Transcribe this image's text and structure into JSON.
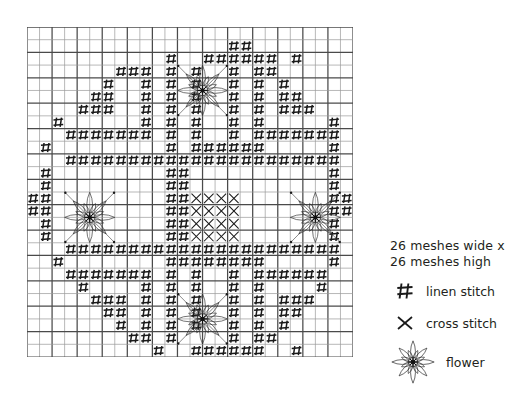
{
  "chart": {
    "name": "needlework-pattern-chart",
    "type": "stitch-chart",
    "cols": 26,
    "rows": 26,
    "cell_px": 12.54,
    "grid_color": "#4a4a4a",
    "grid_color_light": "#9a9a9a",
    "symbol_color": "#1a1a1a",
    "heavy_line_every": 2,
    "symbols": {
      "linen": "#",
      "cross": "×",
      "flower": "flower"
    },
    "linen_cells": [
      [
        16,
        1
      ],
      [
        17,
        1
      ],
      [
        11,
        2
      ],
      [
        14,
        2
      ],
      [
        15,
        2
      ],
      [
        16,
        2
      ],
      [
        17,
        2
      ],
      [
        18,
        2
      ],
      [
        19,
        2
      ],
      [
        21,
        2
      ],
      [
        8,
        3
      ],
      [
        9,
        3
      ],
      [
        11,
        3
      ],
      [
        13,
        3
      ],
      [
        16,
        3
      ],
      [
        18,
        3
      ],
      [
        19,
        3
      ],
      [
        7,
        3
      ],
      [
        6,
        4
      ],
      [
        9,
        4
      ],
      [
        11,
        4
      ],
      [
        13,
        4
      ],
      [
        16,
        4
      ],
      [
        18,
        4
      ],
      [
        20,
        4
      ],
      [
        5,
        5
      ],
      [
        6,
        5
      ],
      [
        9,
        5
      ],
      [
        11,
        5
      ],
      [
        13,
        5
      ],
      [
        16,
        5
      ],
      [
        18,
        5
      ],
      [
        20,
        5
      ],
      [
        21,
        5
      ],
      [
        4,
        6
      ],
      [
        5,
        6
      ],
      [
        6,
        6
      ],
      [
        9,
        6
      ],
      [
        11,
        6
      ],
      [
        13,
        6
      ],
      [
        16,
        6
      ],
      [
        18,
        6
      ],
      [
        20,
        6
      ],
      [
        21,
        6
      ],
      [
        22,
        6
      ],
      [
        2,
        7
      ],
      [
        9,
        7
      ],
      [
        11,
        7
      ],
      [
        13,
        7
      ],
      [
        16,
        7
      ],
      [
        18,
        7
      ],
      [
        24,
        7
      ],
      [
        3,
        8
      ],
      [
        4,
        8
      ],
      [
        5,
        8
      ],
      [
        6,
        8
      ],
      [
        7,
        8
      ],
      [
        8,
        8
      ],
      [
        9,
        8
      ],
      [
        11,
        8
      ],
      [
        13,
        8
      ],
      [
        16,
        8
      ],
      [
        18,
        8
      ],
      [
        19,
        8
      ],
      [
        20,
        8
      ],
      [
        21,
        8
      ],
      [
        22,
        8
      ],
      [
        23,
        8
      ],
      [
        24,
        8
      ],
      [
        1,
        9
      ],
      [
        11,
        9
      ],
      [
        13,
        9
      ],
      [
        14,
        9
      ],
      [
        15,
        9
      ],
      [
        16,
        9
      ],
      [
        17,
        9
      ],
      [
        18,
        9
      ],
      [
        24,
        9
      ],
      [
        3,
        10
      ],
      [
        4,
        10
      ],
      [
        5,
        10
      ],
      [
        6,
        10
      ],
      [
        7,
        10
      ],
      [
        8,
        10
      ],
      [
        9,
        10
      ],
      [
        10,
        10
      ],
      [
        11,
        10
      ],
      [
        12,
        10
      ],
      [
        13,
        10
      ],
      [
        14,
        10
      ],
      [
        15,
        10
      ],
      [
        16,
        10
      ],
      [
        17,
        10
      ],
      [
        18,
        10
      ],
      [
        19,
        10
      ],
      [
        20,
        10
      ],
      [
        21,
        10
      ],
      [
        22,
        10
      ],
      [
        23,
        10
      ],
      [
        24,
        10
      ],
      [
        1,
        11
      ],
      [
        11,
        11
      ],
      [
        12,
        11
      ],
      [
        24,
        11
      ],
      [
        1,
        12
      ],
      [
        11,
        12
      ],
      [
        12,
        12
      ],
      [
        24,
        12
      ],
      [
        0,
        13
      ],
      [
        1,
        13
      ],
      [
        11,
        13
      ],
      [
        12,
        13
      ],
      [
        24,
        13
      ],
      [
        25,
        13
      ],
      [
        0,
        14
      ],
      [
        1,
        14
      ],
      [
        11,
        14
      ],
      [
        12,
        14
      ],
      [
        24,
        14
      ],
      [
        25,
        14
      ],
      [
        1,
        15
      ],
      [
        11,
        15
      ],
      [
        12,
        15
      ],
      [
        24,
        15
      ],
      [
        1,
        16
      ],
      [
        11,
        16
      ],
      [
        12,
        16
      ],
      [
        24,
        16
      ],
      [
        3,
        17
      ],
      [
        4,
        17
      ],
      [
        5,
        17
      ],
      [
        6,
        17
      ],
      [
        7,
        17
      ],
      [
        8,
        17
      ],
      [
        9,
        17
      ],
      [
        10,
        17
      ],
      [
        11,
        17
      ],
      [
        12,
        17
      ],
      [
        13,
        17
      ],
      [
        14,
        17
      ],
      [
        15,
        17
      ],
      [
        16,
        17
      ],
      [
        17,
        17
      ],
      [
        18,
        17
      ],
      [
        19,
        17
      ],
      [
        20,
        17
      ],
      [
        21,
        17
      ],
      [
        22,
        17
      ],
      [
        23,
        17
      ],
      [
        24,
        17
      ],
      [
        2,
        18
      ],
      [
        11,
        18
      ],
      [
        12,
        18
      ],
      [
        13,
        18
      ],
      [
        14,
        18
      ],
      [
        15,
        18
      ],
      [
        16,
        18
      ],
      [
        17,
        18
      ],
      [
        18,
        18
      ],
      [
        24,
        18
      ],
      [
        3,
        19
      ],
      [
        4,
        19
      ],
      [
        5,
        19
      ],
      [
        6,
        19
      ],
      [
        7,
        19
      ],
      [
        8,
        19
      ],
      [
        9,
        19
      ],
      [
        11,
        19
      ],
      [
        13,
        19
      ],
      [
        16,
        19
      ],
      [
        18,
        19
      ],
      [
        19,
        19
      ],
      [
        20,
        19
      ],
      [
        21,
        19
      ],
      [
        22,
        19
      ],
      [
        23,
        19
      ],
      [
        4,
        20
      ],
      [
        9,
        20
      ],
      [
        11,
        20
      ],
      [
        13,
        20
      ],
      [
        16,
        20
      ],
      [
        18,
        20
      ],
      [
        23,
        20
      ],
      [
        5,
        21
      ],
      [
        6,
        21
      ],
      [
        7,
        21
      ],
      [
        9,
        21
      ],
      [
        11,
        21
      ],
      [
        13,
        21
      ],
      [
        16,
        21
      ],
      [
        18,
        21
      ],
      [
        20,
        21
      ],
      [
        21,
        21
      ],
      [
        22,
        21
      ],
      [
        6,
        22
      ],
      [
        7,
        22
      ],
      [
        9,
        22
      ],
      [
        11,
        22
      ],
      [
        13,
        22
      ],
      [
        16,
        22
      ],
      [
        18,
        22
      ],
      [
        20,
        22
      ],
      [
        21,
        22
      ],
      [
        7,
        23
      ],
      [
        9,
        23
      ],
      [
        11,
        23
      ],
      [
        13,
        23
      ],
      [
        16,
        23
      ],
      [
        18,
        23
      ],
      [
        20,
        23
      ],
      [
        8,
        24
      ],
      [
        9,
        24
      ],
      [
        11,
        24
      ],
      [
        16,
        24
      ],
      [
        18,
        24
      ],
      [
        19,
        24
      ],
      [
        10,
        25
      ],
      [
        13,
        25
      ],
      [
        14,
        25
      ],
      [
        15,
        25
      ],
      [
        16,
        25
      ],
      [
        17,
        25
      ],
      [
        18,
        25
      ],
      [
        21,
        25
      ]
    ],
    "cross_cells": [
      [
        13,
        13
      ],
      [
        14,
        13
      ],
      [
        15,
        13
      ],
      [
        16,
        13
      ],
      [
        13,
        14
      ],
      [
        14,
        14
      ],
      [
        15,
        14
      ],
      [
        16,
        14
      ],
      [
        13,
        15
      ],
      [
        14,
        15
      ],
      [
        15,
        15
      ],
      [
        16,
        15
      ],
      [
        13,
        16
      ],
      [
        14,
        16
      ],
      [
        15,
        16
      ],
      [
        16,
        16
      ]
    ],
    "flowers": [
      {
        "col": 12,
        "row": 3,
        "w": 4,
        "h": 4
      },
      {
        "col": 3,
        "row": 13,
        "w": 4,
        "h": 4
      },
      {
        "col": 21,
        "row": 13,
        "w": 4,
        "h": 4
      },
      {
        "col": 12,
        "row": 21,
        "w": 4,
        "h": 4
      }
    ]
  },
  "legend": {
    "title_line1": "26 meshes wide x",
    "title_line2": "26 meshes high",
    "items": [
      {
        "symbol": "linen-stitch-icon",
        "label": "linen stitch"
      },
      {
        "symbol": "cross-stitch-icon",
        "label": "cross stitch"
      },
      {
        "symbol": "flower-icon",
        "label": "flower"
      }
    ]
  }
}
